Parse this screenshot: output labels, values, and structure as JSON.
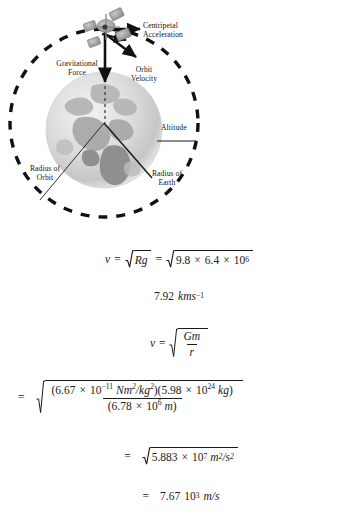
{
  "figure": {
    "labels": {
      "centripetal": "Centripetal\nAcceleration",
      "gravitational": "Gravitational\nForce",
      "orbit_velocity": "Orbit\nVelocity",
      "altitude": "Altitude",
      "radius_of_orbit": "Radius of\nOrbit",
      "radius_of_earth": "Radius of\nEarth"
    },
    "colors": {
      "ink": "#1a1a1a",
      "orbit_dash": "#111111",
      "earth_light": "#e9e9e9",
      "earth_mid": "#cfcfcf",
      "earth_dark": "#9d9d9d",
      "satellite": "#9a9a9a"
    }
  },
  "math": {
    "eq1": {
      "v": "v",
      "eq": "=",
      "rad1": "Rg",
      "eq2": "=",
      "n1": "9.8",
      "times1": "×",
      "n2": "6.4",
      "times2": "×",
      "n3": "10",
      "exp3": "6"
    },
    "eq2": {
      "value": "7.92",
      "unit": "kms",
      "exp": "−1"
    },
    "eq3": {
      "v": "v",
      "eq": "=",
      "num": "Gm",
      "den": "r",
      "den_sub": ""
    },
    "eq4": {
      "lead": "=",
      "num_open1": "(",
      "g_mantissa": "6.67",
      "times_a": "×",
      "g_base": "10",
      "g_exp": "−11",
      "g_unit": "Nm",
      "g_unit_exp": "2",
      "g_unit_div": "/kg",
      "g_unit_div_exp": "2",
      "num_close1": ")",
      "num_open2": "(",
      "m_mantissa": "5.98",
      "times_b": "×",
      "m_base": "10",
      "m_exp": "24",
      "m_unit": "kg",
      "num_close2": ")",
      "den_open": "(",
      "r_mantissa": "6.78",
      "times_c": "×",
      "r_base": "10",
      "r_exp": "6",
      "r_unit": "m",
      "den_close": ")"
    },
    "eq5": {
      "lead": "=",
      "mantissa": "5.883",
      "times": "×",
      "base": "10",
      "exp": "7",
      "unit_num": "m",
      "unit_num_exp": "2",
      "unit_den": "/s",
      "unit_den_exp": "2"
    },
    "eq6": {
      "lead": "=",
      "value": "7.67",
      "base": "10",
      "exp": "3",
      "unit": "m/s"
    }
  }
}
